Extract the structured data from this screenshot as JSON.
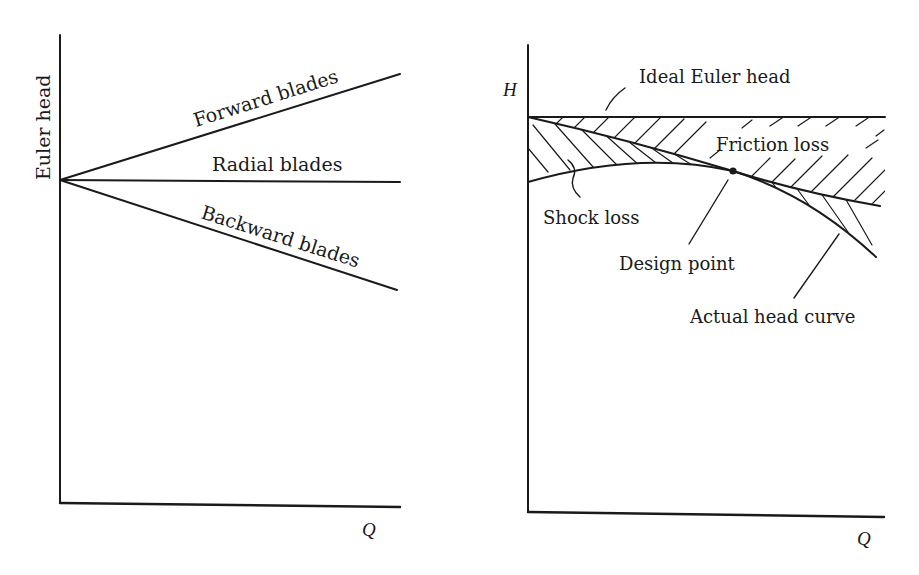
{
  "left_panel": {
    "y_axis_label": "Euler head",
    "x_axis_label": "Q",
    "curves": [
      {
        "label": "Forward blades",
        "trend": "rising"
      },
      {
        "label": "Radial blades",
        "trend": "flat"
      },
      {
        "label": "Backward blades",
        "trend": "falling"
      }
    ]
  },
  "right_panel": {
    "y_axis_label": "H",
    "x_axis_label": "Q",
    "annotations": {
      "ideal": "Ideal Euler head",
      "friction": "Friction loss",
      "shock": "Shock loss",
      "design": "Design point",
      "actual": "Actual head curve"
    }
  },
  "colors": {
    "ink": "#1a1a1a",
    "background": "#ffffff"
  }
}
